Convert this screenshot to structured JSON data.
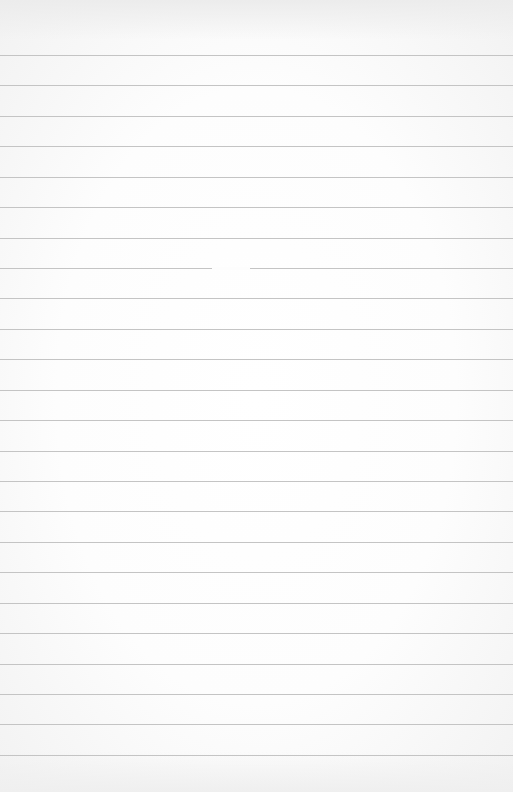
{
  "paper": {
    "type": "lined-paper",
    "background_color": "#ffffff",
    "rule_color": "#c4c4c4",
    "first_rule_y": 55,
    "rule_spacing": 30.43,
    "rule_count": 24
  }
}
